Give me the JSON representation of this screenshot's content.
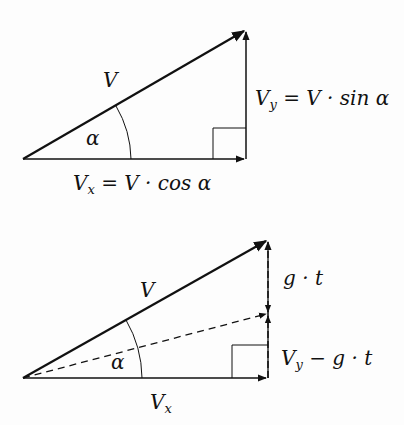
{
  "diagram1": {
    "labels": {
      "v": "V",
      "alpha": "α",
      "vy_main": "V",
      "vy_sub": "y",
      "vy_rest": " = V · sin α",
      "vx_main": "V",
      "vx_sub": "x",
      "vx_rest": " = V · cos α"
    }
  },
  "diagram2": {
    "labels": {
      "v": "V",
      "alpha": "α",
      "gt": "g · t",
      "vyg_main": "V",
      "vyg_sub": "y",
      "vyg_rest": " − g · t",
      "vx_main": "V",
      "vx_sub": "x"
    }
  },
  "colors": {
    "stroke": "#111111",
    "background": "#fdfdfd"
  }
}
